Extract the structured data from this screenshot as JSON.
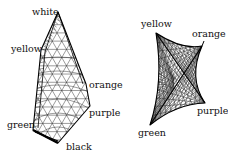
{
  "meshes": [
    {
      "id": "left",
      "vertices": [
        {
          "name": "white",
          "label": "white",
          "x": 58,
          "y": 12
        },
        {
          "name": "yellow",
          "label": "yellow",
          "x": 41,
          "y": 50
        },
        {
          "name": "green",
          "label": "green",
          "x": 33,
          "y": 130
        },
        {
          "name": "black",
          "label": "black",
          "x": 58,
          "y": 143
        },
        {
          "name": "purple",
          "label": "purple",
          "x": 90,
          "y": 106
        },
        {
          "name": "orange",
          "label": "orange",
          "x": 86,
          "y": 84
        }
      ],
      "labels": {
        "white": {
          "x": 32,
          "y": 15
        },
        "yellow": {
          "x": 11,
          "y": 52
        },
        "orange": {
          "x": 89,
          "y": 88
        },
        "purple": {
          "x": 89,
          "y": 116
        },
        "green": {
          "x": 7,
          "y": 128
        },
        "black": {
          "x": 66,
          "y": 150
        }
      }
    },
    {
      "id": "right",
      "vertices": [
        {
          "name": "yellow",
          "label": "yellow",
          "x": 156,
          "y": 33
        },
        {
          "name": "orange",
          "label": "orange",
          "x": 202,
          "y": 46
        },
        {
          "name": "purple",
          "label": "purple",
          "x": 205,
          "y": 103
        },
        {
          "name": "green",
          "label": "green",
          "x": 150,
          "y": 125
        }
      ],
      "labels": {
        "yellow": {
          "x": 141,
          "y": 27
        },
        "orange": {
          "x": 192,
          "y": 37
        },
        "purple": {
          "x": 197,
          "y": 114
        },
        "green": {
          "x": 138,
          "y": 136
        }
      }
    }
  ]
}
